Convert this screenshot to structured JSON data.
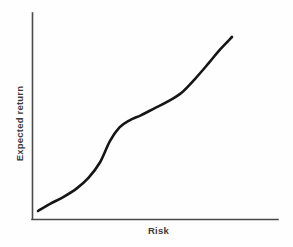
{
  "chart_data": {
    "type": "line",
    "title": "",
    "subtitle": "",
    "xlabel": "Risk",
    "ylabel": "Expected return",
    "grid": false,
    "legend": null,
    "legend_position": "none",
    "axis_style": "open-left-bottom-spines",
    "tick_labels_x": [],
    "tick_labels_y": [],
    "xlim": [
      0,
      1
    ],
    "ylim": [
      0,
      1
    ],
    "annotations": [],
    "series": [
      {
        "name": "Risk-return curve",
        "color": "#161616",
        "line_width": 2.6,
        "shape": "double-sigmoid increasing",
        "description": "Monotonically increasing curve: gentle slope at low risk, a steep rise through the lower-middle, a flatter shoulder near the middle, then a final steep climb at high risk.",
        "x": [
          0.0,
          0.06,
          0.13,
          0.2,
          0.26,
          0.32,
          0.37,
          0.42,
          0.47,
          0.53,
          0.6,
          0.67,
          0.74,
          0.81,
          0.88,
          0.94,
          1.0
        ],
        "y": [
          0.0,
          0.04,
          0.08,
          0.13,
          0.19,
          0.28,
          0.4,
          0.48,
          0.52,
          0.55,
          0.59,
          0.63,
          0.68,
          0.76,
          0.85,
          0.93,
          1.0
        ]
      }
    ]
  },
  "axes": {
    "x_axis_name": "x-axis",
    "y_axis_name": "y-axis",
    "axis_color": "#4a4a4a"
  },
  "colors": {
    "background": "#fefefe",
    "curve": "#161616",
    "axis": "#4a4a4a",
    "label_text": "#3b3b3b"
  }
}
